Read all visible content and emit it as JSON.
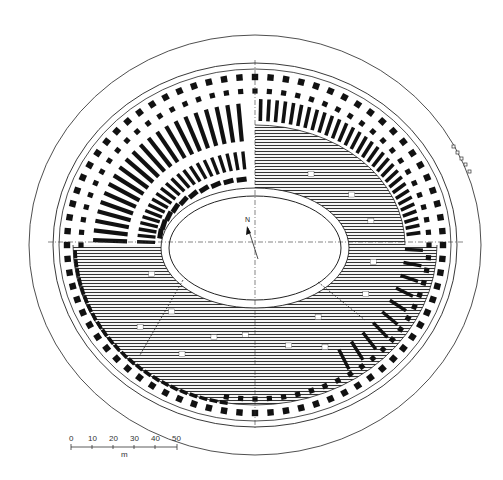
{
  "figure": {
    "colors": {
      "ink": "#111111",
      "paper": "#ffffff",
      "hatch": "#555555"
    }
  },
  "north_arrow": {
    "label": "N",
    "icon": "north-arrow-icon"
  },
  "scale_bar": {
    "ticks": [
      "0",
      "10",
      "20",
      "30",
      "40",
      "50"
    ],
    "unit": "m"
  },
  "geometry": {
    "center": [
      255,
      245
    ],
    "outer_boundary": {
      "rx": 226,
      "ry": 210
    },
    "facade": {
      "rx": 200,
      "ry": 180
    },
    "arena": {
      "rx": 86,
      "ry": 52
    }
  }
}
